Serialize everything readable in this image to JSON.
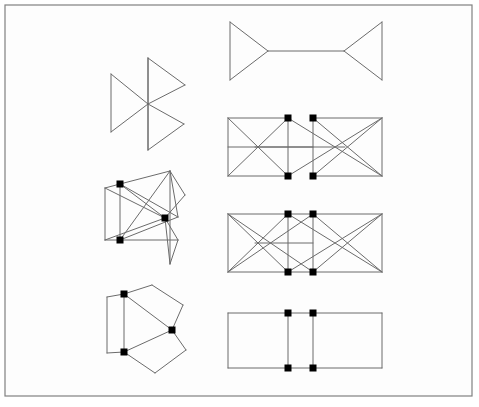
{
  "canvas": {
    "width": 479,
    "height": 407,
    "background_color": "#ffffff",
    "panel_background_color": "#fdfdfd"
  },
  "frame": {
    "label": "outer-border",
    "x": 5,
    "y": 5,
    "width": 467,
    "height": 391,
    "stroke_color": "#808080",
    "stroke_width": 1.2
  },
  "style": {
    "edge_color": "#6b6b6b",
    "edge_dark_color": "#4a4a4a",
    "node_color": "#000000",
    "node_size": 7
  },
  "figures": [
    {
      "id": "left-1",
      "name": "pinwheel-triangles",
      "column": "left",
      "row": 1,
      "edges": [
        [
          [
            148,
            58
          ],
          [
            148,
            150
          ]
        ],
        [
          [
            148,
            58
          ],
          [
            185,
            85
          ]
        ],
        [
          [
            185,
            85
          ],
          [
            148,
            104
          ]
        ],
        [
          [
            148,
            104
          ],
          [
            148,
            58
          ]
        ],
        [
          [
            111,
            74
          ],
          [
            111,
            132
          ]
        ],
        [
          [
            111,
            74
          ],
          [
            148,
            104
          ]
        ],
        [
          [
            148,
            104
          ],
          [
            111,
            132
          ]
        ],
        [
          [
            148,
            104
          ],
          [
            184,
            124
          ]
        ],
        [
          [
            184,
            124
          ],
          [
            148,
            150
          ]
        ],
        [
          [
            148,
            104
          ],
          [
            148,
            150
          ]
        ]
      ],
      "nodes": []
    },
    {
      "id": "left-2",
      "name": "crossed-quadrilateral-cluster",
      "column": "left",
      "row": 2,
      "edges": [
        [
          [
            105,
            188
          ],
          [
            105,
            240
          ]
        ],
        [
          [
            105,
            188
          ],
          [
            120,
            184
          ]
        ],
        [
          [
            105,
            240
          ],
          [
            120,
            240
          ]
        ],
        [
          [
            120,
            184
          ],
          [
            170,
            171
          ]
        ],
        [
          [
            170,
            171
          ],
          [
            178,
            217
          ]
        ],
        [
          [
            178,
            217
          ],
          [
            120,
            240
          ]
        ],
        [
          [
            120,
            240
          ],
          [
            120,
            184
          ]
        ],
        [
          [
            120,
            184
          ],
          [
            178,
            217
          ]
        ],
        [
          [
            120,
            240
          ],
          [
            170,
            171
          ]
        ],
        [
          [
            170,
            171
          ],
          [
            170,
            264
          ]
        ],
        [
          [
            170,
            171
          ],
          [
            185,
            195
          ]
        ],
        [
          [
            185,
            195
          ],
          [
            165,
            218
          ]
        ],
        [
          [
            165,
            218
          ],
          [
            178,
            240
          ]
        ],
        [
          [
            178,
            240
          ],
          [
            170,
            264
          ]
        ],
        [
          [
            120,
            240
          ],
          [
            178,
            240
          ]
        ],
        [
          [
            105,
            188
          ],
          [
            165,
            218
          ]
        ],
        [
          [
            105,
            240
          ],
          [
            165,
            218
          ]
        ],
        [
          [
            120,
            184
          ],
          [
            165,
            218
          ]
        ],
        [
          [
            165,
            218
          ],
          [
            170,
            264
          ]
        ]
      ],
      "nodes": [
        [
          120,
          184
        ],
        [
          165,
          218
        ],
        [
          120,
          240
        ]
      ]
    },
    {
      "id": "left-3",
      "name": "three-panel-fan",
      "column": "left",
      "row": 3,
      "edges": [
        [
          [
            107,
            297
          ],
          [
            107,
            353
          ]
        ],
        [
          [
            107,
            297
          ],
          [
            124,
            294
          ]
        ],
        [
          [
            107,
            353
          ],
          [
            124,
            352
          ]
        ],
        [
          [
            124,
            294
          ],
          [
            124,
            352
          ]
        ],
        [
          [
            124,
            294
          ],
          [
            152,
            285
          ]
        ],
        [
          [
            152,
            285
          ],
          [
            183,
            305
          ]
        ],
        [
          [
            183,
            305
          ],
          [
            172,
            330
          ]
        ],
        [
          [
            172,
            330
          ],
          [
            124,
            294
          ]
        ],
        [
          [
            172,
            330
          ],
          [
            186,
            350
          ]
        ],
        [
          [
            186,
            350
          ],
          [
            155,
            373
          ]
        ],
        [
          [
            155,
            373
          ],
          [
            124,
            352
          ]
        ],
        [
          [
            124,
            352
          ],
          [
            172,
            330
          ]
        ]
      ],
      "nodes": [
        [
          124,
          294
        ],
        [
          172,
          330
        ],
        [
          124,
          352
        ]
      ]
    },
    {
      "id": "right-1",
      "name": "twin-triangles-bridge",
      "column": "right",
      "row": 1,
      "edges": [
        [
          [
            230,
            22
          ],
          [
            230,
            80
          ]
        ],
        [
          [
            230,
            22
          ],
          [
            268,
            51
          ]
        ],
        [
          [
            268,
            51
          ],
          [
            230,
            80
          ]
        ],
        [
          [
            268,
            51
          ],
          [
            344,
            51
          ]
        ],
        [
          [
            344,
            51
          ],
          [
            382,
            22
          ]
        ],
        [
          [
            382,
            22
          ],
          [
            382,
            80
          ]
        ],
        [
          [
            382,
            80
          ],
          [
            344,
            51
          ]
        ]
      ],
      "nodes": []
    },
    {
      "id": "right-2",
      "name": "double-rectangle-crossed-offset",
      "column": "right",
      "row": 2,
      "edges": [
        [
          [
            228,
            118
          ],
          [
            288,
            118
          ]
        ],
        [
          [
            228,
            118
          ],
          [
            228,
            176
          ]
        ],
        [
          [
            228,
            176
          ],
          [
            288,
            176
          ]
        ],
        [
          [
            288,
            118
          ],
          [
            288,
            176
          ]
        ],
        [
          [
            228,
            118
          ],
          [
            288,
            176
          ]
        ],
        [
          [
            228,
            176
          ],
          [
            288,
            118
          ]
        ],
        [
          [
            313,
            118
          ],
          [
            382,
            118
          ]
        ],
        [
          [
            313,
            118
          ],
          [
            313,
            176
          ]
        ],
        [
          [
            313,
            176
          ],
          [
            382,
            176
          ]
        ],
        [
          [
            382,
            118
          ],
          [
            382,
            176
          ]
        ],
        [
          [
            313,
            118
          ],
          [
            382,
            176
          ]
        ],
        [
          [
            313,
            176
          ],
          [
            382,
            118
          ]
        ],
        [
          [
            288,
            118
          ],
          [
            382,
            176
          ]
        ],
        [
          [
            288,
            176
          ],
          [
            382,
            118
          ]
        ],
        [
          [
            228,
            147
          ],
          [
            313,
            147
          ]
        ],
        [
          [
            255,
            147
          ],
          [
            345,
            147
          ]
        ]
      ],
      "nodes": [
        [
          288,
          118
        ],
        [
          313,
          118
        ],
        [
          288,
          176
        ],
        [
          313,
          176
        ]
      ]
    },
    {
      "id": "right-3",
      "name": "double-rectangle-crossed-aligned",
      "column": "right",
      "row": 3,
      "edges": [
        [
          [
            228,
            214
          ],
          [
            382,
            214
          ]
        ],
        [
          [
            228,
            214
          ],
          [
            228,
            272
          ]
        ],
        [
          [
            228,
            272
          ],
          [
            382,
            272
          ]
        ],
        [
          [
            382,
            214
          ],
          [
            382,
            272
          ]
        ],
        [
          [
            288,
            214
          ],
          [
            288,
            272
          ]
        ],
        [
          [
            313,
            214
          ],
          [
            313,
            272
          ]
        ],
        [
          [
            228,
            214
          ],
          [
            288,
            272
          ]
        ],
        [
          [
            228,
            272
          ],
          [
            288,
            214
          ]
        ],
        [
          [
            313,
            214
          ],
          [
            382,
            272
          ]
        ],
        [
          [
            313,
            272
          ],
          [
            382,
            214
          ]
        ],
        [
          [
            228,
            214
          ],
          [
            313,
            272
          ]
        ],
        [
          [
            228,
            272
          ],
          [
            313,
            214
          ]
        ],
        [
          [
            288,
            214
          ],
          [
            382,
            272
          ]
        ],
        [
          [
            288,
            272
          ],
          [
            382,
            214
          ]
        ],
        [
          [
            255,
            243
          ],
          [
            313,
            243
          ]
        ]
      ],
      "nodes": [
        [
          288,
          214
        ],
        [
          313,
          214
        ],
        [
          288,
          272
        ],
        [
          313,
          272
        ]
      ]
    },
    {
      "id": "right-4",
      "name": "triple-rectangle-plain",
      "column": "right",
      "row": 4,
      "edges": [
        [
          [
            228,
            313
          ],
          [
            382,
            313
          ]
        ],
        [
          [
            228,
            313
          ],
          [
            228,
            368
          ]
        ],
        [
          [
            228,
            368
          ],
          [
            382,
            368
          ]
        ],
        [
          [
            382,
            313
          ],
          [
            382,
            368
          ]
        ],
        [
          [
            288,
            313
          ],
          [
            288,
            368
          ]
        ],
        [
          [
            313,
            313
          ],
          [
            313,
            368
          ]
        ]
      ],
      "nodes": [
        [
          288,
          313
        ],
        [
          313,
          313
        ],
        [
          288,
          368
        ],
        [
          313,
          368
        ]
      ]
    }
  ]
}
